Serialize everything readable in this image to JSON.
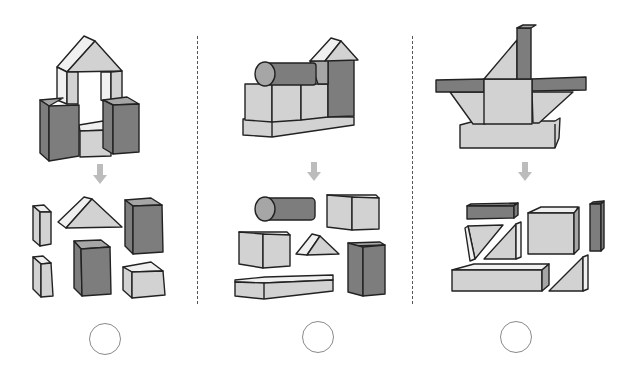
{
  "puzzle": {
    "type": "block-matching",
    "panel_count": 3,
    "colors": {
      "dark_face": "#7d7d7d",
      "mid_face": "#a6a6a6",
      "light_face": "#d2d2d2",
      "top_face": "#f0f0f0",
      "outline": "#222222",
      "arrow": "#bcbcbc",
      "divider": "#555555",
      "circle": "#8a8a8a"
    },
    "panels": [
      {
        "id": 1,
        "structure": "arch tower with triangular roof on two pillars between two dark cuboids",
        "pieces": [
          "small light pillar",
          "triangular prism",
          "tall dark cuboid",
          "small light pillar",
          "dark cuboid",
          "light cuboid"
        ],
        "answer_mark": ""
      },
      {
        "id": 2,
        "structure": "cylinder on cubes with dark tower and triangular roof on long base",
        "pieces": [
          "dark cylinder",
          "light cube",
          "light cube",
          "triangular prism",
          "dark tall cuboid",
          "long flat base"
        ],
        "answer_mark": ""
      },
      {
        "id": 3,
        "structure": "cross shape with dark bars, center cube, triangles and long base",
        "pieces": [
          "dark flat bar",
          "triangle pair",
          "light cuboid",
          "dark thin bar",
          "long base",
          "triangle"
        ],
        "answer_mark": ""
      }
    ]
  }
}
